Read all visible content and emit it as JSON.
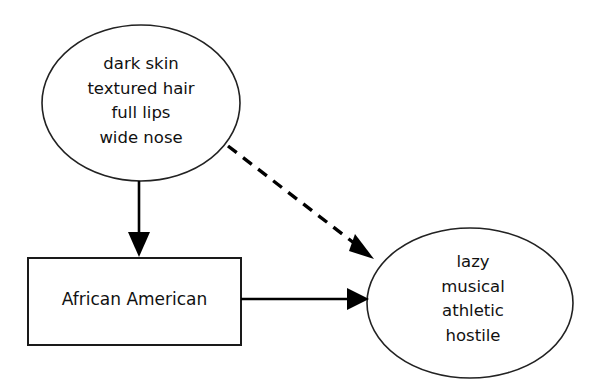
{
  "diagram": {
    "background_color": "#ffffff",
    "stroke_color": "#000000",
    "nodes": [
      {
        "id": "traits",
        "shape": "ellipse",
        "name": "physical-traits-node",
        "lines": [
          "dark skin",
          "textured hair",
          "full lips",
          "wide nose"
        ]
      },
      {
        "id": "group",
        "shape": "rectangle",
        "name": "social-category-node",
        "lines": [
          "African American"
        ]
      },
      {
        "id": "stereotype",
        "shape": "ellipse",
        "name": "stereotype-attributes-node",
        "lines": [
          "lazy",
          "musical",
          "athletic",
          "hostile"
        ]
      }
    ],
    "edges": [
      {
        "id": "traits-to-group",
        "name": "traits-to-group-arrow",
        "style": "solid",
        "from": "traits",
        "to": "group",
        "direction": "down"
      },
      {
        "id": "traits-to-stereotype",
        "name": "traits-to-stereotype-dashed-arrow",
        "style": "dashed",
        "from": "traits",
        "to": "stereotype",
        "direction": "diagonal-down-right"
      },
      {
        "id": "group-to-stereotype",
        "name": "group-to-stereotype-arrow",
        "style": "solid",
        "from": "group",
        "to": "stereotype",
        "direction": "right"
      }
    ]
  },
  "traits_node": {
    "line1": "dark skin",
    "line2": "textured hair",
    "line3": "full lips",
    "line4": "wide nose"
  },
  "group_node": {
    "line1": "African American"
  },
  "stereotype_node": {
    "line1": "lazy",
    "line2": "musical",
    "line3": "athletic",
    "line4": "hostile"
  }
}
